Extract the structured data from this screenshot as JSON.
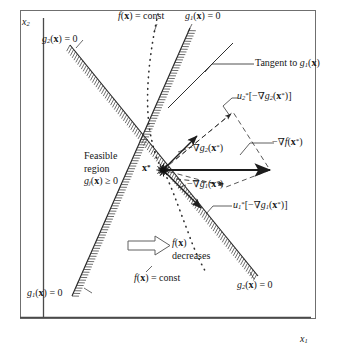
{
  "figure": {
    "axes": {
      "x_label": "x1",
      "y_label": "x2"
    },
    "colors": {
      "ink": "#171717",
      "line": "#2b2b2b",
      "hatch": "#3a3a3a",
      "dotted": "#333333"
    },
    "point_label": "x*",
    "labels": {
      "y_axis": "x",
      "y_axis_sub": "2",
      "x_axis": "x",
      "x_axis_sub": "1",
      "g2_top": "g",
      "g2_top_sub": "2",
      "g2_top_rest": "(x) = 0",
      "f_const_top": "f(x) = const",
      "g1_top": "g",
      "g1_top_sub": "1",
      "g1_top_rest": "(x) = 0",
      "tangent": "Tangent to g",
      "tangent_sub": "1",
      "tangent_rest": "(x)",
      "u2_term": "[−∇g",
      "u2_head": "u",
      "u2_sub": "2",
      "u2_sup": "*",
      "u2_inner_sub": "2",
      "u2_tail": "(x*)]",
      "grad_f": "−∇f(x*)",
      "grad_g2": "−∇g",
      "grad_g2_sub": "2",
      "grad_g2_rest": "(x*)",
      "grad_g1": "−∇g",
      "grad_g1_sub": "1",
      "grad_g1_rest": "(x*)",
      "u1_head": "u",
      "u1_sub": "1",
      "u1_sup": "*",
      "u1_term": "[−∇g",
      "u1_inner_sub": "1",
      "u1_tail": "(x*)]",
      "feasible_line1": "Feasible",
      "feasible_line2": "region",
      "feasible_line3": "g",
      "feasible_line3_sub": "j",
      "feasible_line3_rest": "(x) ≥ 0",
      "f_decreases_line1": "f(x)",
      "f_decreases_line2": "decreases",
      "f_const_bottom": "f(x) = const",
      "g1_bottom": "g",
      "g1_bottom_sub": "1",
      "g1_bottom_rest": "(x) = 0",
      "g2_bottom": "g",
      "g2_bottom_sub": "2",
      "g2_bottom_rest": "(x) = 0"
    }
  },
  "chart_data": {
    "type": "diagram",
    "xlabel": "x1",
    "ylabel": "x2",
    "grid": false,
    "legend": "none",
    "optimum_point": {
      "name": "x*",
      "x": 163,
      "y": 170
    },
    "constraint_curves": [
      {
        "name": "g2(x) = 0",
        "from": [
          70,
          45
        ],
        "to": [
          258,
          276
        ],
        "feasible_side": "below-left",
        "hatched": true
      },
      {
        "name": "g1(x) = 0",
        "from": [
          72,
          296
        ],
        "to": [
          190,
          28
        ],
        "feasible_side": "left",
        "hatched": true
      }
    ],
    "objective_contour": {
      "name": "f(x) = const",
      "style": "dotted",
      "points": [
        [
          158,
          14
        ],
        [
          150,
          48
        ],
        [
          146,
          86
        ],
        [
          148,
          120
        ],
        [
          156,
          154
        ],
        [
          163,
          170
        ],
        [
          172,
          196
        ],
        [
          184,
          227
        ],
        [
          196,
          253
        ],
        [
          206,
          272
        ]
      ]
    },
    "vectors": [
      {
        "name": "-grad f(x*)",
        "from": [
          163,
          170
        ],
        "to": [
          268,
          170
        ],
        "style": "solid-arrow"
      },
      {
        "name": "-grad g2(x*)",
        "from": [
          163,
          170
        ],
        "to": [
          196,
          136
        ],
        "style": "solid-arrow"
      },
      {
        "name": "-grad g1(x*)",
        "from": [
          163,
          170
        ],
        "to": [
          200,
          207
        ],
        "style": "solid-arrow"
      },
      {
        "name": "u2*[-grad g2(x*)]",
        "from": [
          163,
          170
        ],
        "to": [
          233,
          112
        ],
        "style": "dashed-arrow"
      },
      {
        "name": "u1*[-grad g1(x*)]",
        "from": [
          163,
          170
        ],
        "to": [
          228,
          186
        ],
        "style": "dashed-arrow"
      }
    ],
    "parallelogram": {
      "vertices": [
        [
          163,
          170
        ],
        [
          233,
          112
        ],
        [
          268,
          170
        ],
        [
          228,
          186
        ]
      ],
      "style": "dashed"
    },
    "tangent_line": {
      "name": "Tangent to g1(x)",
      "from": [
        172,
        100
      ],
      "to": [
        232,
        44
      ]
    },
    "decrease_arrow": {
      "label": "f(x) decreases",
      "direction": "right",
      "from": [
        133,
        245
      ],
      "to": [
        168,
        245
      ]
    }
  }
}
